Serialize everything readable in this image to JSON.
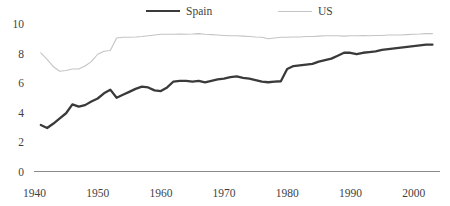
{
  "legend": {
    "position": "top-center",
    "entries": [
      {
        "name": "Spain",
        "color": "#3a3a3a",
        "width": 2.4
      },
      {
        "name": "US",
        "color": "#c4c4c4",
        "width": 1.1
      }
    ]
  },
  "axes": {
    "y_ticks": [
      "0",
      "2",
      "4",
      "6",
      "8",
      "10"
    ],
    "x_ticks": [
      "1940",
      "1950",
      "1960",
      "1970",
      "1980",
      "1990",
      "2000"
    ]
  },
  "chart_data": {
    "type": "line",
    "title": "",
    "subtitle": "",
    "xlabel": "",
    "ylabel": "",
    "xlim": [
      1940,
      2003
    ],
    "ylim": [
      0,
      10
    ],
    "grid": false,
    "legend_position": "top-center",
    "x_ticks": [
      1940,
      1950,
      1960,
      1970,
      1980,
      1990,
      2000
    ],
    "y_ticks": [
      0,
      2,
      4,
      6,
      8,
      10
    ],
    "series": [
      {
        "name": "Spain",
        "color": "#3a3a3a",
        "x": [
          1941,
          1942,
          1943,
          1944,
          1945,
          1946,
          1947,
          1948,
          1949,
          1950,
          1951,
          1952,
          1953,
          1954,
          1955,
          1956,
          1957,
          1958,
          1959,
          1960,
          1961,
          1962,
          1963,
          1964,
          1965,
          1966,
          1967,
          1968,
          1969,
          1970,
          1971,
          1972,
          1973,
          1974,
          1975,
          1976,
          1977,
          1978,
          1979,
          1980,
          1981,
          1982,
          1983,
          1984,
          1985,
          1986,
          1987,
          1988,
          1989,
          1990,
          1991,
          1992,
          1993,
          1994,
          1995,
          1996,
          1997,
          1998,
          1999,
          2000,
          2001,
          2002,
          2003
        ],
        "y": [
          3.15,
          2.95,
          3.25,
          3.6,
          3.95,
          4.55,
          4.4,
          4.5,
          4.75,
          4.95,
          5.3,
          5.55,
          5.0,
          5.2,
          5.4,
          5.6,
          5.75,
          5.7,
          5.5,
          5.45,
          5.7,
          6.1,
          6.15,
          6.15,
          6.1,
          6.15,
          6.05,
          6.15,
          6.25,
          6.3,
          6.4,
          6.45,
          6.35,
          6.3,
          6.2,
          6.1,
          6.05,
          6.1,
          6.12,
          6.95,
          7.15,
          7.2,
          7.25,
          7.3,
          7.45,
          7.55,
          7.65,
          7.85,
          8.05,
          8.05,
          7.95,
          8.05,
          8.1,
          8.15,
          8.25,
          8.3,
          8.35,
          8.4,
          8.45,
          8.5,
          8.55,
          8.6,
          8.6
        ]
      },
      {
        "name": "US",
        "color": "#c4c4c4",
        "x": [
          1941,
          1942,
          1943,
          1944,
          1945,
          1946,
          1947,
          1948,
          1949,
          1950,
          1951,
          1952,
          1953,
          1954,
          1955,
          1956,
          1957,
          1958,
          1959,
          1960,
          1961,
          1962,
          1963,
          1964,
          1965,
          1966,
          1967,
          1968,
          1969,
          1970,
          1971,
          1972,
          1973,
          1974,
          1975,
          1976,
          1977,
          1978,
          1979,
          1980,
          1981,
          1982,
          1983,
          1984,
          1985,
          1986,
          1987,
          1988,
          1989,
          1990,
          1991,
          1992,
          1993,
          1994,
          1995,
          1996,
          1997,
          1998,
          1999,
          2000,
          2001,
          2002,
          2003
        ],
        "y": [
          8.05,
          7.6,
          7.1,
          6.8,
          6.85,
          6.95,
          6.95,
          7.15,
          7.45,
          7.95,
          8.15,
          8.2,
          9.05,
          9.1,
          9.1,
          9.12,
          9.15,
          9.2,
          9.25,
          9.3,
          9.3,
          9.3,
          9.32,
          9.3,
          9.32,
          9.35,
          9.3,
          9.28,
          9.25,
          9.22,
          9.2,
          9.2,
          9.18,
          9.15,
          9.12,
          9.1,
          9.0,
          9.05,
          9.1,
          9.1,
          9.12,
          9.12,
          9.15,
          9.15,
          9.18,
          9.2,
          9.2,
          9.2,
          9.18,
          9.2,
          9.2,
          9.22,
          9.2,
          9.22,
          9.22,
          9.25,
          9.25,
          9.25,
          9.28,
          9.3,
          9.32,
          9.35,
          9.35
        ]
      }
    ]
  }
}
